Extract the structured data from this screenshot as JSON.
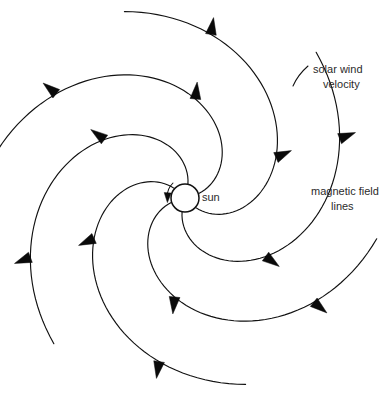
{
  "figure": {
    "width": 384,
    "height": 407,
    "background_color": "#ffffff",
    "stroke_color": "#111111",
    "arrow_color": "#0a0a0a",
    "text_color": "#2b2b2b"
  },
  "sun": {
    "label": "sun",
    "center_x": 185,
    "center_y": 198,
    "radius": 14,
    "label_x": 202,
    "label_y": 198
  },
  "labels": {
    "solar_wind": {
      "line1": "solar wind",
      "line2": "velocity",
      "x": 313,
      "y1": 70,
      "y2": 85
    },
    "magnetic_field": {
      "line1": "magnetic field",
      "line2": "lines",
      "x": 311,
      "y1": 192,
      "y2": 207
    }
  },
  "chart_data": {
    "type": "scatter",
    "xlabel": "",
    "ylabel": "",
    "arm_count": 6,
    "arrows_per_arm": 2,
    "rotation_sense": "counterclockwise",
    "center": [
      185,
      198
    ],
    "sun_radius": 14,
    "arm_start_angles_deg": [
      18,
      78,
      138,
      198,
      258,
      318
    ],
    "arm_sweep_deg": 150,
    "arm_max_radius": 196,
    "legend": [
      "solar wind velocity",
      "magnetic field lines"
    ],
    "annotations": [
      "sun",
      "solar wind velocity",
      "magnetic field lines"
    ]
  }
}
